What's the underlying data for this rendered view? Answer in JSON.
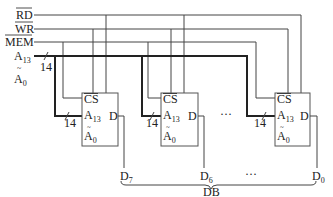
{
  "signals": {
    "rd": "RD",
    "wr": "WR",
    "mem": "MEM",
    "addr_hi": "A",
    "addr_hi_sub": "13",
    "addr_lo": "A",
    "addr_lo_sub": "0",
    "addr_tilde": "~",
    "bus_width": "14"
  },
  "chips": [
    {
      "cs": "CS",
      "a_hi": "A",
      "a_hi_sub": "13",
      "a_lo": "A",
      "a_lo_sub": "0",
      "tilde": "~",
      "d": "D",
      "bus_width": "14",
      "data_line": "D",
      "data_line_sub": "7"
    },
    {
      "cs": "CS",
      "a_hi": "A",
      "a_hi_sub": "13",
      "a_lo": "A",
      "a_lo_sub": "0",
      "tilde": "~",
      "d": "D",
      "bus_width": "14",
      "data_line": "D",
      "data_line_sub": "6"
    },
    {
      "cs": "CS",
      "a_hi": "A",
      "a_hi_sub": "13",
      "a_lo": "A",
      "a_lo_sub": "0",
      "tilde": "~",
      "d": "D",
      "bus_width": "14",
      "data_line": "D",
      "data_line_sub": "0"
    }
  ],
  "ellipsis_chips": "···",
  "ellipsis_data": "···",
  "data_bus_label": "DB"
}
